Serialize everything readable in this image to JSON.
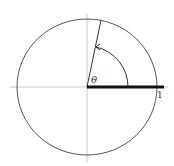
{
  "diagram": {
    "theta_label": "θ",
    "unit_label": "1",
    "colors": {
      "axis": "#c8c8c8",
      "circle": "#555555",
      "segment": "#111111"
    }
  }
}
